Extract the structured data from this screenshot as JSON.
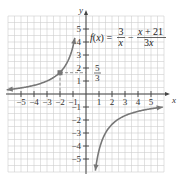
{
  "chart_data": {
    "type": "line",
    "function_label": {
      "lhs": "f(x) =",
      "term1_num": "3",
      "term1_den": "x",
      "minus": "−",
      "term2_num": "x + 21",
      "term2_den": "3x"
    },
    "xlabel": "x",
    "ylabel": "y",
    "xlim": [
      -6,
      6
    ],
    "ylim": [
      -6,
      6
    ],
    "grid": true,
    "x_ticks": [
      "−5",
      "−4",
      "−3",
      "−2",
      "−1",
      "1",
      "2",
      "3",
      "4",
      "5"
    ],
    "y_ticks": [
      "5",
      "4",
      "3",
      "2",
      "1",
      "−1",
      "−2",
      "−3",
      "−4",
      "−5"
    ],
    "series": [
      {
        "name": "left branch",
        "x": [
          -6,
          -5,
          -4,
          -3,
          -2,
          -1.5,
          -1,
          -0.8
        ],
        "y": [
          0.33,
          0.47,
          0.67,
          1.0,
          1.67,
          2.33,
          3.67,
          4.67
        ]
      },
      {
        "name": "right branch",
        "x": [
          0.7,
          1,
          1.5,
          2,
          3,
          4,
          5,
          6
        ],
        "y": [
          -6.05,
          -4.33,
          -3.0,
          -2.33,
          -1.67,
          -1.33,
          -1.13,
          -1.0
        ]
      }
    ],
    "highlighted_point": {
      "x": -2,
      "y": 1.6667,
      "label_num": "5",
      "label_den": "3"
    },
    "asymptotes": {
      "vertical": 0,
      "horizontal": -0.3333
    }
  }
}
